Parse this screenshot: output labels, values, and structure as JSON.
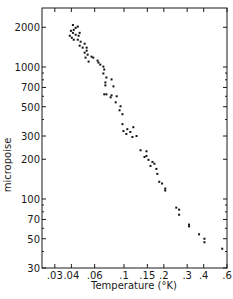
{
  "chart_data": {
    "type": "scatter",
    "title": "",
    "xlabel": "Temperature (°K)",
    "ylabel": "micropoise",
    "xscale": "log",
    "yscale": "log",
    "xlim": [
      0.024,
      0.6
    ],
    "ylim": [
      30,
      2800
    ],
    "grid": false,
    "legend": null,
    "x_ticks": [
      {
        "value": 0.03,
        "label": ".03"
      },
      {
        "value": 0.04,
        "label": ".04"
      },
      {
        "value": 0.06,
        "label": ".06"
      },
      {
        "value": 0.1,
        "label": ".1"
      },
      {
        "value": 0.15,
        "label": ".15"
      },
      {
        "value": 0.2,
        "label": ".2"
      },
      {
        "value": 0.3,
        "label": ".3"
      },
      {
        "value": 0.4,
        "label": ".4"
      },
      {
        "value": 0.6,
        "label": ".6"
      }
    ],
    "y_ticks": [
      {
        "value": 2000,
        "label": "2000"
      },
      {
        "value": 1000,
        "label": "1000"
      },
      {
        "value": 700,
        "label": "700"
      },
      {
        "value": 500,
        "label": "500"
      },
      {
        "value": 300,
        "label": "300"
      },
      {
        "value": 200,
        "label": "200"
      },
      {
        "value": 100,
        "label": "100"
      },
      {
        "value": 70,
        "label": "70"
      },
      {
        "value": 50,
        "label": "50"
      },
      {
        "value": 30,
        "label": "30"
      }
    ],
    "y_minor_ticks": [
      3000,
      900,
      800,
      600,
      400,
      90,
      80,
      60,
      40
    ],
    "series": [
      {
        "name": "viscosity",
        "points": [
          [
            0.0411,
            2080
          ],
          [
            0.0431,
            1980
          ],
          [
            0.0447,
            2025
          ],
          [
            0.0417,
            1912
          ],
          [
            0.0397,
            1880
          ],
          [
            0.0411,
            1815
          ],
          [
            0.0389,
            1725
          ],
          [
            0.0431,
            1757
          ],
          [
            0.0454,
            1725
          ],
          [
            0.0462,
            1815
          ],
          [
            0.0403,
            1666
          ],
          [
            0.0417,
            1610
          ],
          [
            0.0447,
            1610
          ],
          [
            0.047,
            1555
          ],
          [
            0.0462,
            1451
          ],
          [
            0.0504,
            1502
          ],
          [
            0.0487,
            1402
          ],
          [
            0.0522,
            1402
          ],
          [
            0.0504,
            1284
          ],
          [
            0.0531,
            1240
          ],
          [
            0.0512,
            1178
          ],
          [
            0.054,
            1099
          ],
          [
            0.0522,
            1330
          ],
          [
            0.0568,
            1198
          ],
          [
            0.0586,
            1178
          ],
          [
            0.0631,
            1118
          ],
          [
            0.0641,
            1080
          ],
          [
            0.0662,
            1043
          ],
          [
            0.0698,
            1007
          ],
          [
            0.0709,
            957
          ],
          [
            0.0698,
            893
          ],
          [
            0.0736,
            833
          ],
          [
            0.0723,
            764
          ],
          [
            0.0805,
            805
          ],
          [
            0.0723,
            726
          ],
          [
            0.0832,
            713
          ],
          [
            0.0736,
            621
          ],
          [
            0.0709,
            621
          ],
          [
            0.0805,
            610
          ],
          [
            0.0792,
            589
          ],
          [
            0.088,
            600
          ],
          [
            0.0865,
            540
          ],
          [
            0.0941,
            504
          ],
          [
            0.0925,
            470
          ],
          [
            0.0973,
            439
          ],
          [
            0.0973,
            369
          ],
          [
            0.099,
            327
          ],
          [
            0.1041,
            311
          ],
          [
            0.1116,
            322
          ],
          [
            0.1176,
            350
          ],
          [
            0.1059,
            338
          ],
          [
            0.1157,
            295
          ],
          [
            0.1243,
            300
          ],
          [
            0.1333,
            234
          ],
          [
            0.1478,
            230
          ],
          [
            0.1478,
            212
          ],
          [
            0.1428,
            208
          ],
          [
            0.153,
            198
          ],
          [
            0.164,
            191
          ],
          [
            0.1584,
            178
          ],
          [
            0.1696,
            185
          ],
          [
            0.1756,
            169
          ],
          [
            0.1784,
            155
          ],
          [
            0.1846,
            135
          ],
          [
            0.194,
            131
          ],
          [
            0.2048,
            120
          ],
          [
            0.2048,
            116
          ],
          [
            0.2481,
            86
          ],
          [
            0.2608,
            83
          ],
          [
            0.2608,
            76
          ],
          [
            0.31,
            64
          ],
          [
            0.31,
            62
          ],
          [
            0.369,
            54
          ],
          [
            0.4052,
            50
          ],
          [
            0.4052,
            47
          ],
          [
            0.552,
            42
          ]
        ]
      }
    ]
  }
}
